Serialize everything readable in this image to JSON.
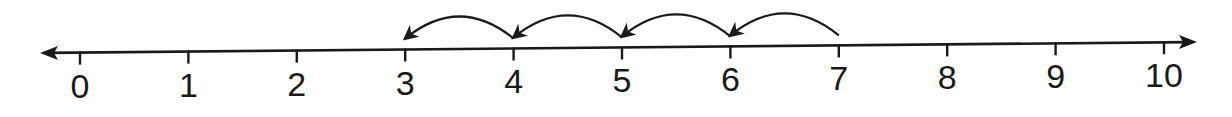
{
  "number_line": {
    "min": 0,
    "max": 10,
    "tick_labels": [
      "0",
      "1",
      "2",
      "3",
      "4",
      "5",
      "6",
      "7",
      "8",
      "9",
      "10"
    ],
    "arrows_both_ends": true,
    "line_color": "#1a1a1a"
  },
  "jumps": {
    "start": 7,
    "end": 3,
    "step": -1,
    "count": 4,
    "hops": [
      {
        "from": 7,
        "to": 6
      },
      {
        "from": 6,
        "to": 5
      },
      {
        "from": 5,
        "to": 4
      },
      {
        "from": 4,
        "to": 3
      }
    ]
  }
}
